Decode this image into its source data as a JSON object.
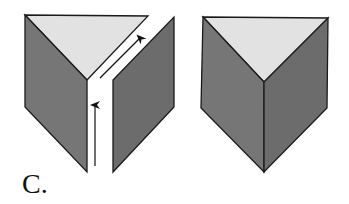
{
  "label": "C.",
  "colors": {
    "top_face": "#e2e2e2",
    "left_face": "#767676",
    "right_face": "#6c6c6c",
    "stroke": "#1a1a1a",
    "background": "#ffffff"
  },
  "figures": [
    {
      "name": "unfolded-prism",
      "description": "Triangular prism with one vertical edge cut open; arrows indicate path along the cut",
      "arrows": [
        {
          "direction": "up",
          "from": [
            95,
            165
          ],
          "to": [
            95,
            103
          ]
        },
        {
          "direction": "up-right",
          "from": [
            100,
            78
          ],
          "to": [
            141,
            37
          ]
        }
      ]
    },
    {
      "name": "closed-prism",
      "description": "Complete triangular prism viewed from above"
    }
  ]
}
